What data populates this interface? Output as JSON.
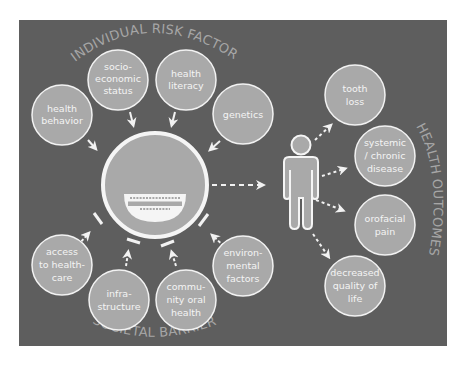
{
  "diagram": {
    "title_top": "INDIVIDUAL RISK FACTORS",
    "title_bottom": "SOCIETAL BARRIERS",
    "title_right": "HEALTH OUTCOMES",
    "colors": {
      "panel": "#5e5e5e",
      "node_fill": "#a9a9a9",
      "node_stroke": "#f2f2f2",
      "arrow": "#f2f2f2",
      "title_text": "#a6a6a6",
      "node_text": "#f4f4f4"
    },
    "individual_risk_factors": [
      {
        "lines": [
          "health",
          "behavior"
        ]
      },
      {
        "lines": [
          "socio-",
          "economic",
          "status"
        ]
      },
      {
        "lines": [
          "health",
          "literacy"
        ]
      },
      {
        "lines": [
          "genetics"
        ]
      }
    ],
    "societal_barriers": [
      {
        "lines": [
          "access",
          "to health-",
          "care"
        ]
      },
      {
        "lines": [
          "infra-",
          "structure"
        ]
      },
      {
        "lines": [
          "commu-",
          "nity oral",
          "health"
        ]
      },
      {
        "lines": [
          "environ-",
          "mental",
          "factors"
        ]
      }
    ],
    "health_outcomes": [
      {
        "lines": [
          "tooth",
          "loss"
        ]
      },
      {
        "lines": [
          "systemic",
          "/ chronic",
          "disease"
        ]
      },
      {
        "lines": [
          "orofacial",
          "pain"
        ]
      },
      {
        "lines": [
          "decreased",
          "quality of",
          "life"
        ]
      }
    ],
    "center": {
      "icon": "smiling-mouth-icon"
    },
    "person": {
      "icon": "person-icon"
    }
  }
}
